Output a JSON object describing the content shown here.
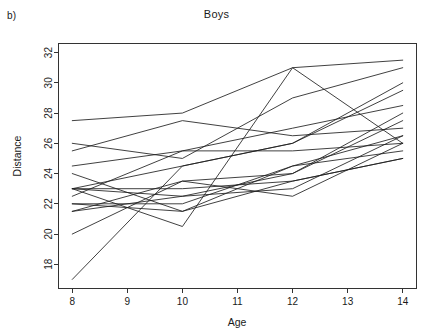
{
  "panel": {
    "tag": "b)"
  },
  "chart_data": {
    "type": "line",
    "title": "Boys",
    "xlabel": "Age",
    "ylabel": "Distance",
    "x": [
      8,
      10,
      12,
      14
    ],
    "xlim": [
      7.75,
      14.25
    ],
    "ylim": [
      16.4,
      32.6
    ],
    "xticks": [
      8,
      9,
      10,
      11,
      12,
      13,
      14
    ],
    "xticklabels": [
      "8",
      "9",
      "10",
      "11",
      "12",
      "13",
      "14"
    ],
    "yticks": [
      18,
      20,
      22,
      24,
      26,
      28,
      30,
      32
    ],
    "yticklabels": [
      "18",
      "20",
      "22",
      "24",
      "26",
      "28",
      "30",
      "32"
    ],
    "grid": false,
    "legend": false,
    "line_color": "#1f1f1f",
    "series": [
      {
        "name": "M01",
        "values": [
          26.0,
          25.0,
          29.0,
          31.0
        ]
      },
      {
        "name": "M02",
        "values": [
          21.5,
          22.5,
          23.0,
          26.5
        ]
      },
      {
        "name": "M03",
        "values": [
          23.0,
          22.5,
          24.0,
          27.5
        ]
      },
      {
        "name": "M04",
        "values": [
          25.5,
          27.5,
          26.5,
          27.0
        ]
      },
      {
        "name": "M05",
        "values": [
          20.0,
          23.5,
          22.5,
          26.0
        ]
      },
      {
        "name": "M06",
        "values": [
          24.5,
          25.5,
          27.0,
          28.5
        ]
      },
      {
        "name": "M07",
        "values": [
          22.0,
          22.0,
          24.5,
          26.5
        ]
      },
      {
        "name": "M08",
        "values": [
          24.0,
          21.5,
          24.5,
          25.5
        ]
      },
      {
        "name": "M09",
        "values": [
          23.0,
          20.5,
          31.0,
          26.0
        ]
      },
      {
        "name": "M10",
        "values": [
          27.5,
          28.0,
          31.0,
          31.5
        ]
      },
      {
        "name": "M11",
        "values": [
          23.0,
          23.0,
          23.5,
          25.0
        ]
      },
      {
        "name": "M12",
        "values": [
          21.5,
          23.5,
          24.0,
          28.0
        ]
      },
      {
        "name": "M13",
        "values": [
          17.0,
          24.5,
          26.0,
          29.5
        ]
      },
      {
        "name": "M14",
        "values": [
          22.5,
          25.5,
          25.5,
          26.0
        ]
      },
      {
        "name": "M15",
        "values": [
          23.0,
          24.5,
          26.0,
          30.0
        ]
      },
      {
        "name": "M16",
        "values": [
          22.0,
          21.5,
          23.5,
          25.0
        ]
      }
    ]
  }
}
